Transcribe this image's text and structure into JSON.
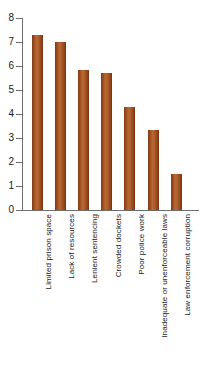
{
  "chart_data": {
    "type": "bar",
    "title": "",
    "subtitle": "",
    "xlabel": "",
    "ylabel": "",
    "ylim": [
      0,
      8
    ],
    "ytick_labels": [
      "0",
      "1",
      "2",
      "3",
      "4",
      "5",
      "6",
      "7",
      "8"
    ],
    "ytick_values": [
      0,
      1,
      2,
      3,
      4,
      5,
      6,
      7,
      8
    ],
    "grid": false,
    "legend": null,
    "orientation": "vertical",
    "categories": [
      "Limited prison space",
      "Lack of resources",
      "Lenient sentencing",
      "Crowded dockets",
      "Poor police work",
      "Inadequate or unenforceable laws",
      "Law enforcement corruption"
    ],
    "values": [
      7.3,
      7.0,
      5.85,
      5.7,
      4.3,
      3.35,
      1.5
    ],
    "bar_color": "#9c4a1e",
    "bar_color_light": "#b86a34",
    "bar_color_dark": "#6f3414",
    "axis_color": "#6e6e6e",
    "background_color": "#ffffff"
  }
}
